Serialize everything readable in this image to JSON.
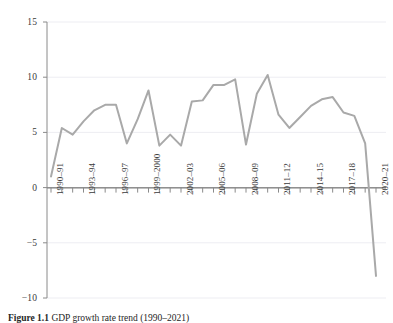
{
  "figure": {
    "caption_label": "Figure 1.1",
    "caption_text": "GDP growth rate trend (1990–2021)"
  },
  "chart_data": {
    "type": "line",
    "title": "",
    "subtitle": "",
    "xlabel": "",
    "ylabel": "",
    "ylim": [
      -10,
      15
    ],
    "yticks": [
      15,
      10,
      5,
      0,
      -5,
      -10
    ],
    "ytick_labels": [
      "15",
      "10",
      "5",
      "0",
      "−5",
      "−10"
    ],
    "grid": true,
    "grid_axis": "y",
    "legend": false,
    "legend_position": "none",
    "line_color": "#a9a9a9",
    "line_width": 2.0,
    "categories": [
      "1990–91",
      "1991–92",
      "1992–93",
      "1993–94",
      "1994–95",
      "1995–96",
      "1996–97",
      "1997–98",
      "1998–99",
      "1999–2000",
      "2000–01",
      "2001–02",
      "2002–03",
      "2003–04",
      "2004–05",
      "2005–06",
      "2006–07",
      "2007–08",
      "2008–09",
      "2009–10",
      "2010–11",
      "2011–12",
      "2012–13",
      "2013–14",
      "2014–15",
      "2015–16",
      "2016–17",
      "2017–18",
      "2018–19",
      "2019–20",
      "2020–21"
    ],
    "values": [
      1.0,
      5.4,
      4.8,
      6.0,
      7.0,
      7.5,
      7.5,
      4.0,
      6.2,
      8.8,
      3.8,
      4.8,
      3.8,
      7.8,
      7.9,
      9.3,
      9.3,
      9.8,
      3.9,
      8.5,
      10.2,
      6.6,
      5.4,
      6.4,
      7.4,
      8.0,
      8.2,
      6.8,
      6.5,
      4.0,
      -8.0
    ],
    "labeled_xticks": [
      "1990–91",
      "1993–94",
      "1996–97",
      "1999–2000",
      "2002–03",
      "2005–06",
      "2008–09",
      "2011–12",
      "2014–15",
      "2017–18",
      "2020–21"
    ]
  }
}
